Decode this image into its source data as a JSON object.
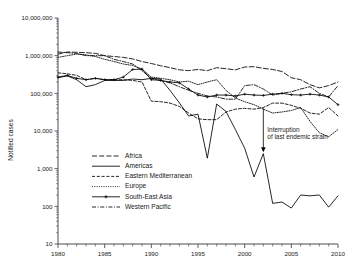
{
  "chart_data": {
    "type": "line",
    "title": "",
    "xlabel": "",
    "ylabel": "Notified cases",
    "yscale": "log",
    "ylim": [
      10,
      10000000
    ],
    "xlim": [
      1980,
      2010
    ],
    "grid": false,
    "legend_position": "center-left",
    "y_ticks": [
      "10",
      "100",
      "1,000",
      "10,000",
      "100,000",
      "1,000,000",
      "10,000,000"
    ],
    "y_tick_values": [
      10,
      100,
      1000,
      10000,
      100000,
      1000000,
      10000000
    ],
    "x_ticks": [
      "1980",
      "1985",
      "1990",
      "1995",
      "2000",
      "2005",
      "2010"
    ],
    "x_tick_values": [
      1980,
      1985,
      1990,
      1995,
      2000,
      2005,
      2010
    ],
    "x": [
      1980,
      1981,
      1982,
      1983,
      1984,
      1985,
      1986,
      1987,
      1988,
      1989,
      1990,
      1991,
      1992,
      1993,
      1994,
      1995,
      1996,
      1997,
      1998,
      1999,
      2000,
      2001,
      2002,
      2003,
      2004,
      2005,
      2006,
      2007,
      2008,
      2009,
      2010
    ],
    "series": [
      {
        "name": "Africa",
        "style": "long-dash",
        "values": [
          1100000,
          1250000,
          1230000,
          1200000,
          1150000,
          1000000,
          950000,
          900000,
          820000,
          700000,
          620000,
          540000,
          480000,
          420000,
          400000,
          430000,
          400000,
          480000,
          450000,
          420000,
          500000,
          510000,
          460000,
          430000,
          380000,
          260000,
          230000,
          170000,
          140000,
          160000,
          200000
        ]
      },
      {
        "name": "Americas",
        "style": "solid",
        "values": [
          260000,
          290000,
          230000,
          150000,
          170000,
          220000,
          220000,
          220000,
          240000,
          230000,
          250000,
          240000,
          120000,
          56000,
          25000,
          28000,
          1900,
          52000,
          33000,
          11000,
          3500,
          600,
          2500,
          120,
          130,
          90,
          200,
          190,
          200,
          95,
          190
        ]
      },
      {
        "name": "Eastern Mediterranean",
        "style": "dash",
        "values": [
          350000,
          330000,
          300000,
          230000,
          250000,
          230000,
          230000,
          230000,
          220000,
          200000,
          62000,
          60000,
          55000,
          45000,
          30000,
          21000,
          20000,
          20000,
          32000,
          38000,
          40000,
          38000,
          42000,
          55000,
          55000,
          48000,
          40000,
          30000,
          28000,
          42000,
          25000
        ]
      },
      {
        "name": "Europe",
        "style": "dot",
        "values": [
          900000,
          1000000,
          1100000,
          1050000,
          950000,
          800000,
          700000,
          600000,
          550000,
          440000,
          270000,
          250000,
          230000,
          200000,
          210000,
          170000,
          200000,
          230000,
          120000,
          75000,
          60000,
          50000,
          38000,
          30000,
          32000,
          35000,
          42000,
          18000,
          9000,
          7000,
          11000
        ]
      },
      {
        "name": "South-East Asia",
        "style": "solid-cross",
        "values": [
          270000,
          300000,
          250000,
          230000,
          250000,
          230000,
          230000,
          270000,
          430000,
          440000,
          230000,
          220000,
          200000,
          190000,
          130000,
          90000,
          80000,
          90000,
          90000,
          85000,
          95000,
          90000,
          88000,
          95000,
          100000,
          92000,
          90000,
          95000,
          90000,
          80000,
          50000
        ]
      },
      {
        "name": "Western Pacific",
        "style": "dash-dot",
        "values": [
          1250000,
          1200000,
          1150000,
          1000000,
          1000000,
          1000000,
          800000,
          700000,
          600000,
          400000,
          250000,
          220000,
          190000,
          150000,
          120000,
          100000,
          85000,
          80000,
          70000,
          70000,
          160000,
          170000,
          130000,
          90000,
          100000,
          110000,
          130000,
          150000,
          100000,
          80000,
          160000
        ]
      }
    ],
    "annotations": [
      {
        "text_line1": "Interruption",
        "text_line2": "of last endemic strain",
        "x": 2002,
        "points_to_value": 2500
      }
    ]
  }
}
